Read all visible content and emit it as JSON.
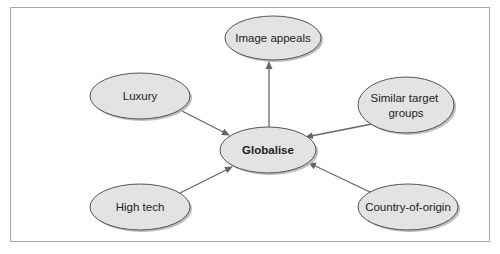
{
  "diagram": {
    "type": "concept-map",
    "center": {
      "id": "globalise",
      "label": "Globalise",
      "bold": true
    },
    "nodes": [
      {
        "id": "image-appeals",
        "lines": [
          "Image appeals"
        ]
      },
      {
        "id": "luxury",
        "lines": [
          "Luxury"
        ]
      },
      {
        "id": "similar-target-groups",
        "lines": [
          "Similar target",
          "groups"
        ]
      },
      {
        "id": "high-tech",
        "lines": [
          "High tech"
        ]
      },
      {
        "id": "country-of-origin",
        "lines": [
          "Country-of-origin"
        ]
      }
    ],
    "edges": [
      {
        "from": "globalise",
        "to": "image-appeals"
      },
      {
        "from": "luxury",
        "to": "globalise"
      },
      {
        "from": "similar-target-groups",
        "to": "globalise"
      },
      {
        "from": "high-tech",
        "to": "globalise"
      },
      {
        "from": "country-of-origin",
        "to": "globalise"
      }
    ],
    "colors": {
      "node_fill": "#e3e3e3",
      "node_stroke": "#555555",
      "shadow": "#bdbdbd",
      "arrow": "#666666",
      "frame": "#aaaaaa"
    }
  }
}
